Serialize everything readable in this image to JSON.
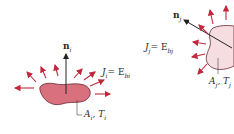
{
  "diagram": {
    "surface_i": {
      "normal_label": "n",
      "normal_sub": "i",
      "radiosity_label": "J",
      "radiosity_sub": "i",
      "radiosity_eq": "= E",
      "radiosity_eq_sub": "bi",
      "area_temp_label": "A",
      "area_sub": "i",
      "temp_label": ", T",
      "temp_sub": "i",
      "fill_color": "#d9707e"
    },
    "surface_j": {
      "normal_label": "n",
      "normal_sub": "j",
      "radiosity_label": "J",
      "radiosity_sub": "j",
      "radiosity_eq": "= E",
      "radiosity_eq_sub": "bj",
      "area_temp_label": "A",
      "area_sub": "j",
      "temp_label": ", T",
      "temp_sub": "j",
      "fill_color": "#f6dde2"
    },
    "arrow_color": "#c0283c"
  }
}
